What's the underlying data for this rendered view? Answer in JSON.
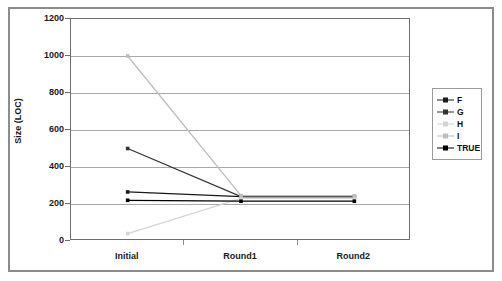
{
  "chart_data": {
    "type": "line",
    "title": "",
    "xlabel": "",
    "ylabel": "Size (LOC)",
    "categories": [
      "Initial",
      "Round1",
      "Round2"
    ],
    "ylim": [
      0,
      1200
    ],
    "yticks": [
      0,
      200,
      400,
      600,
      800,
      1000,
      1200
    ],
    "ytick_labels": [
      "0",
      "200",
      "400",
      "600",
      "800",
      "1000",
      "1200"
    ],
    "grid": true,
    "legend_position": "right-outside",
    "series": [
      {
        "name": "F",
        "color": "#1a1a1a",
        "marker": "square",
        "values": [
          265,
          240,
          240
        ]
      },
      {
        "name": "G",
        "color": "#333333",
        "marker": "square",
        "values": [
          500,
          240,
          240
        ]
      },
      {
        "name": "H",
        "color": "#d4d4d4",
        "marker": "square",
        "values": [
          40,
          230,
          230
        ]
      },
      {
        "name": "I",
        "color": "#bdbdbd",
        "marker": "square",
        "values": [
          1000,
          245,
          245
        ]
      },
      {
        "name": "TRUE",
        "color": "#000000",
        "marker": "square",
        "values": [
          220,
          215,
          215
        ]
      }
    ]
  },
  "legend": {
    "entries": [
      {
        "label": "F"
      },
      {
        "label": "G"
      },
      {
        "label": "H"
      },
      {
        "label": "I"
      },
      {
        "label": "TRUE"
      }
    ]
  }
}
